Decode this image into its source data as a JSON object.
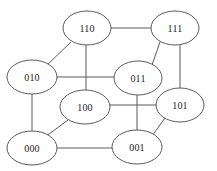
{
  "diagram": {
    "type": "graph",
    "canvas": {
      "width": 217,
      "height": 171
    },
    "style": {
      "background_color": "#ffffff",
      "node_fill": "#ffffff",
      "node_stroke": "#5b5b5b",
      "edge_stroke": "#5b5b5b",
      "label_color": "#1c1c1c"
    },
    "nodes": [
      {
        "id": "110",
        "label": "110",
        "cx": 87,
        "cy": 28,
        "rx": 24,
        "ry": 17
      },
      {
        "id": "111",
        "label": "111",
        "cx": 175,
        "cy": 28,
        "rx": 24,
        "ry": 17
      },
      {
        "id": "010",
        "label": "010",
        "cx": 32,
        "cy": 77,
        "rx": 25,
        "ry": 17
      },
      {
        "id": "011",
        "label": "011",
        "cx": 138,
        "cy": 78,
        "rx": 24,
        "ry": 17
      },
      {
        "id": "100",
        "label": "100",
        "cx": 85,
        "cy": 107,
        "rx": 25,
        "ry": 17
      },
      {
        "id": "101",
        "label": "101",
        "cx": 180,
        "cy": 105,
        "rx": 24,
        "ry": 17
      },
      {
        "id": "000",
        "label": "000",
        "cx": 32,
        "cy": 148,
        "rx": 25,
        "ry": 17
      },
      {
        "id": "001",
        "label": "001",
        "cx": 137,
        "cy": 147,
        "rx": 25,
        "ry": 17
      }
    ],
    "edges": [
      {
        "id": "e-110-111",
        "from": "110",
        "to": "111",
        "x1": 111,
        "y1": 28,
        "x2": 151,
        "y2": 28
      },
      {
        "id": "e-110-010",
        "from": "110",
        "to": "010",
        "x1": 71,
        "y1": 42,
        "x2": 48,
        "y2": 64
      },
      {
        "id": "e-110-100",
        "from": "110",
        "to": "100",
        "x1": 86,
        "y1": 45,
        "x2": 86,
        "y2": 90
      },
      {
        "id": "e-111-011",
        "from": "111",
        "to": "011",
        "x1": 160,
        "y1": 42,
        "x2": 152,
        "y2": 65
      },
      {
        "id": "e-111-101",
        "from": "111",
        "to": "101",
        "x1": 180,
        "y1": 45,
        "x2": 180,
        "y2": 88
      },
      {
        "id": "e-010-011",
        "from": "010",
        "to": "011",
        "x1": 57,
        "y1": 77,
        "x2": 114,
        "y2": 77
      },
      {
        "id": "e-010-000",
        "from": "010",
        "to": "000",
        "x1": 32,
        "y1": 94,
        "x2": 32,
        "y2": 131
      },
      {
        "id": "e-011-001",
        "from": "011",
        "to": "001",
        "x1": 137,
        "y1": 95,
        "x2": 137,
        "y2": 130
      },
      {
        "id": "e-100-101",
        "from": "100",
        "to": "101",
        "x1": 110,
        "y1": 105,
        "x2": 156,
        "y2": 105
      },
      {
        "id": "e-100-000",
        "from": "100",
        "to": "000",
        "x1": 68,
        "y1": 120,
        "x2": 45,
        "y2": 137
      },
      {
        "id": "e-101-001",
        "from": "101",
        "to": "001",
        "x1": 165,
        "y1": 118,
        "x2": 152,
        "y2": 136
      },
      {
        "id": "e-000-001",
        "from": "000",
        "to": "001",
        "x1": 57,
        "y1": 148,
        "x2": 112,
        "y2": 148
      }
    ]
  }
}
